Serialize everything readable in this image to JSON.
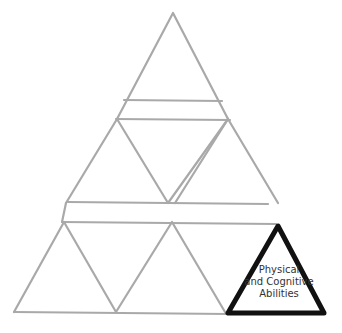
{
  "diagram": {
    "type": "pyramid-of-triangles",
    "highlighted_block": {
      "lines": [
        "Physical",
        "and Cognitive",
        "Abilities"
      ],
      "stroke_color": "#111111"
    },
    "outline_color": "#a9a9a9",
    "unlabeled_blocks": 8
  }
}
